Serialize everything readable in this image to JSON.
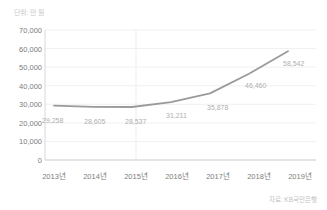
{
  "chart_data": {
    "type": "line",
    "title": "",
    "subtitle": "",
    "unit_note": "단위: 만 원",
    "source_note": "자료: KB국민은행",
    "xlabel": "",
    "ylabel": "",
    "categories": [
      "2013년",
      "2014년",
      "2015년",
      "2016년",
      "2017년",
      "2018년",
      "2019년"
    ],
    "values": [
      29258,
      28605,
      28537,
      31211,
      35878,
      46460,
      58542
    ],
    "point_labels": [
      "29,258",
      "28,605",
      "28,537",
      "31,211",
      "35,878",
      "46,460",
      "58,542"
    ],
    "ylim": [
      0,
      70000
    ],
    "ytick_values": [
      0,
      10000,
      20000,
      30000,
      40000,
      50000,
      60000,
      70000
    ],
    "ytick_labels": [
      "0",
      "10,000",
      "20,000",
      "30,000",
      "40,000",
      "50,000",
      "60,000",
      "70,000"
    ],
    "grid": true,
    "legend": false,
    "series": [
      {
        "name": "",
        "values": [
          29258,
          28605,
          28537,
          31211,
          35878,
          46460,
          58542
        ],
        "color": "#9a9a9a"
      }
    ],
    "colors": {
      "line": "#9a9a9a",
      "grid": "#f0f0f0",
      "axis": "#d8d8d8",
      "tick_text": "#7d7d7d",
      "data_label": "#b0b0b0",
      "note_text": "#c9c9c9",
      "background": "#ffffff"
    }
  }
}
